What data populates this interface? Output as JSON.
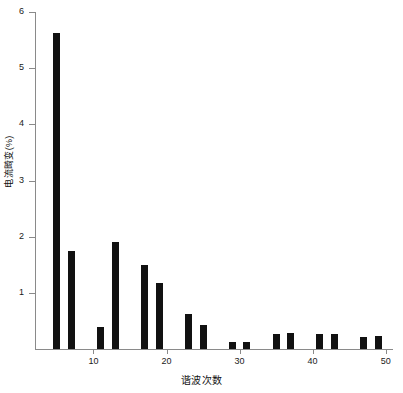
{
  "chart_data": {
    "type": "bar",
    "title": "",
    "xlabel": "谐波次数",
    "ylabel": "电流畸变(%)",
    "xlim": [
      2,
      51
    ],
    "ylim": [
      0,
      6
    ],
    "grid": false,
    "legend": "none",
    "bar_color": "#111111",
    "axis_color": "#8a8a8a",
    "x": [
      5,
      7,
      11,
      13,
      17,
      19,
      23,
      25,
      29,
      31,
      35,
      37,
      41,
      43,
      47,
      49
    ],
    "values": [
      5.63,
      1.75,
      0.4,
      1.9,
      1.5,
      1.17,
      0.62,
      0.43,
      0.13,
      0.12,
      0.27,
      0.28,
      0.27,
      0.27,
      0.22,
      0.23
    ],
    "categories": [
      "5",
      "7",
      "11",
      "13",
      "17",
      "19",
      "23",
      "25",
      "29",
      "31",
      "35",
      "37",
      "41",
      "43",
      "47",
      "49"
    ],
    "ytick_values": [
      1,
      2,
      3,
      4,
      5,
      6
    ],
    "ytick_labels": [
      "1",
      "2",
      "3",
      "4",
      "5",
      "6"
    ],
    "xtick_values": [
      10,
      20,
      30,
      40,
      50
    ],
    "xtick_labels": [
      "10",
      "20",
      "30",
      "40",
      "50"
    ]
  }
}
